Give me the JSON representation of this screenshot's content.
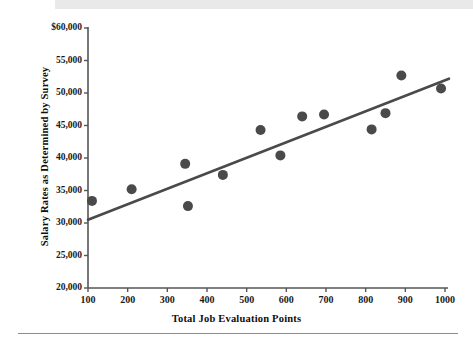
{
  "page": {
    "background_color": "#ffffff",
    "top_band_color": "#e9e9e9",
    "rule_color": "#8c8c8c"
  },
  "chart_data": {
    "type": "scatter",
    "title": "",
    "subtitle": "",
    "xlabel": "Total Job Evaluation Points",
    "ylabel": "Salary Rates as Determined by Survey",
    "xlim": [
      100,
      1000
    ],
    "ylim": [
      20000,
      60000
    ],
    "grid": false,
    "legend": null,
    "xticks": [
      100,
      200,
      300,
      400,
      500,
      600,
      700,
      800,
      900,
      1000
    ],
    "xtick_labels": [
      "100",
      "200",
      "300",
      "400",
      "500",
      "600",
      "700",
      "800",
      "900",
      "1000"
    ],
    "yticks": [
      20000,
      25000,
      30000,
      35000,
      40000,
      45000,
      50000,
      55000,
      60000
    ],
    "ytick_labels": [
      "20,000",
      "25,000",
      "30,000",
      "35,000",
      "40,000",
      "45,000",
      "50,000",
      "55,000",
      "$60,000"
    ],
    "marker_color": "#4a4a4a",
    "marker_size": 5,
    "line_color": "#4a4a4a",
    "axis_color": "#555555",
    "points": [
      {
        "x": 110,
        "y": 33400
      },
      {
        "x": 210,
        "y": 35200
      },
      {
        "x": 345,
        "y": 39100
      },
      {
        "x": 352,
        "y": 32600
      },
      {
        "x": 440,
        "y": 37400
      },
      {
        "x": 535,
        "y": 44300
      },
      {
        "x": 585,
        "y": 40400
      },
      {
        "x": 640,
        "y": 46400
      },
      {
        "x": 695,
        "y": 46700
      },
      {
        "x": 815,
        "y": 44400
      },
      {
        "x": 850,
        "y": 46900
      },
      {
        "x": 890,
        "y": 52700
      },
      {
        "x": 990,
        "y": 50700
      }
    ],
    "trendline": {
      "name": "line of best fit",
      "x_start": 100,
      "y_start": 30500,
      "x_end": 1010,
      "y_end": 52200
    }
  }
}
